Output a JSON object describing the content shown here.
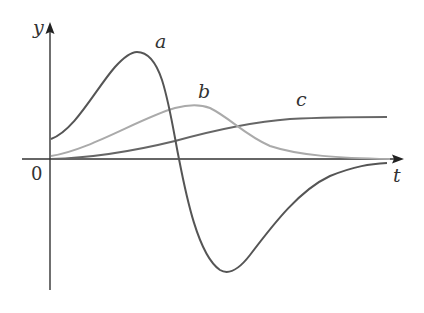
{
  "figure": {
    "axes": {
      "x_label": "t",
      "y_label": "y",
      "origin_label": "0"
    },
    "curves": [
      {
        "id": "a",
        "label": "a",
        "color": "#555555",
        "description": "rises from positive value, peaks, crosses zero, dips to minimum, returns to 0"
      },
      {
        "id": "b",
        "label": "b",
        "color": "#aaaaaa",
        "description": "rises from near 0 to a peak, decays back to 0"
      },
      {
        "id": "c",
        "label": "c",
        "color": "#666666",
        "description": "rises from 0 and levels off at a constant"
      }
    ],
    "colors": {
      "axis": "#333333",
      "background": "#ffffff"
    }
  }
}
